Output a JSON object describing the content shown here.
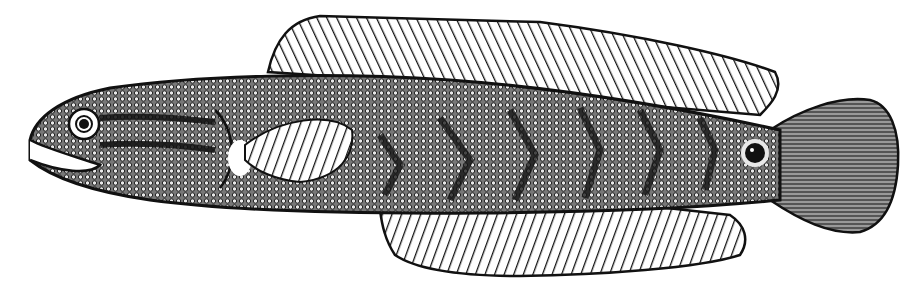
{
  "image": {
    "subject": "Engraved illustration of a snakehead fish in side view",
    "style": "black-and-white engraving",
    "colors": {
      "ink": "#111111",
      "paper": "#ffffff",
      "scale_light": "#e8e8e8"
    },
    "features": [
      "dorsal-fin",
      "anal-fin",
      "pectoral-fin",
      "caudal-fin",
      "eye",
      "mouth",
      "ocellus-spot-near-tail",
      "chevron-bands"
    ]
  }
}
